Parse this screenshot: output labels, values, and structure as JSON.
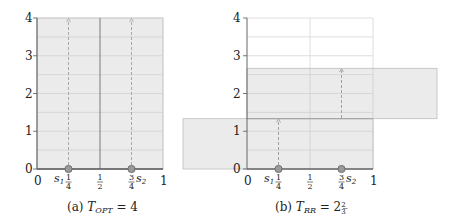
{
  "figures": [
    {
      "id": "a",
      "caption_prefix": "(a) ",
      "caption_var": "T",
      "caption_sub": "OPT",
      "caption_eq": " = 4",
      "x_ticks": [
        "0",
        "1",
        "1",
        "3",
        "1"
      ],
      "x_tick_denoms": [
        "",
        "4",
        "2",
        "4",
        ""
      ],
      "y_ticks": [
        "0",
        "1",
        "2",
        "3",
        "4"
      ],
      "servers": [
        {
          "name": "s",
          "sub": "1",
          "position": "1/4"
        },
        {
          "name": "s",
          "sub": "2",
          "position": "3/4"
        }
      ],
      "shaded_region": {
        "x_from": 0,
        "x_to": 1,
        "y_from": 0,
        "y_to": 4
      },
      "dashed_arrows": [
        {
          "x": 0.25,
          "y_from": 0,
          "y_to": 4
        },
        {
          "x": 0.75,
          "y_from": 0,
          "y_to": 4
        }
      ]
    },
    {
      "id": "b",
      "caption_prefix": "(b) ",
      "caption_var": "T",
      "caption_sub": "RR",
      "caption_eq": " = 2",
      "caption_frac_num": "2",
      "caption_frac_den": "3",
      "x_ticks": [
        "0",
        "1",
        "1",
        "3",
        "1"
      ],
      "x_tick_denoms": [
        "",
        "4",
        "2",
        "4",
        ""
      ],
      "y_ticks": [
        "0",
        "1",
        "2",
        "3",
        "4"
      ],
      "servers": [
        {
          "name": "s",
          "sub": "1",
          "position": "1/4"
        },
        {
          "name": "s",
          "sub": "2",
          "position": "3/4"
        }
      ],
      "shaded_regions": [
        {
          "x_from": -0.5,
          "x_to": 1,
          "y_from": 0,
          "y_to": 1.333
        },
        {
          "x_from": 0,
          "x_to": 1.5,
          "y_from": 1.333,
          "y_to": 2.667
        }
      ],
      "dashed_arrows": [
        {
          "x": 0.25,
          "y_from": 0,
          "y_to": 1.333
        },
        {
          "x": 0.75,
          "y_from": 1.333,
          "y_to": 2.667
        }
      ]
    }
  ],
  "colors": {
    "shade": "#ebebeb",
    "shade_border": "#bdbdbd",
    "grid": "#cfcfcf",
    "axis": "#555555",
    "dash": "#a0a0a0",
    "marker": "#7a7a7a"
  }
}
